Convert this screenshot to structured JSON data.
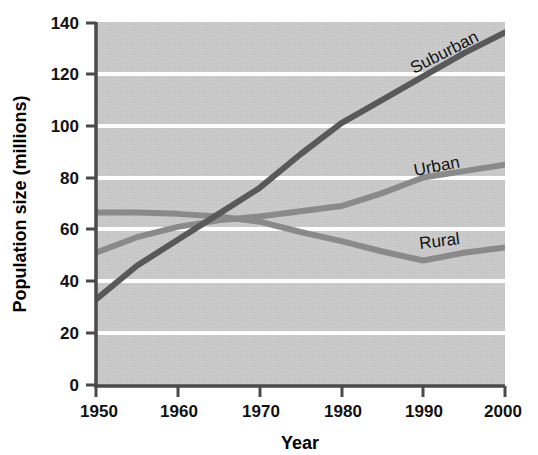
{
  "chart_data": {
    "type": "line",
    "title": "",
    "xlabel": "Year",
    "ylabel": "Population size (millions)",
    "xlim": [
      1950,
      2000
    ],
    "ylim": [
      0,
      140
    ],
    "xticks": [
      1950,
      1960,
      1970,
      1980,
      1990,
      2000
    ],
    "yticks": [
      0,
      20,
      40,
      60,
      80,
      100,
      120,
      140
    ],
    "xtick_labels": [
      "1950",
      "1960",
      "1970",
      "1980",
      "1990",
      "2000"
    ],
    "ytick_labels": [
      "0",
      "20",
      "40",
      "60",
      "80",
      "100",
      "120",
      "140"
    ],
    "grid": "horizontal-white-gridlines",
    "legend": "inline-labels-on-lines",
    "plot_background": "#c9c9c9",
    "x": [
      1950,
      1955,
      1960,
      1965,
      1970,
      1975,
      1980,
      1985,
      1990,
      1995,
      2000
    ],
    "series": [
      {
        "name": "Suburban",
        "color": "#595959",
        "label_rotation_deg": -27,
        "values": [
          33,
          46,
          56,
          66,
          76,
          89,
          101,
          110,
          119,
          128,
          136
        ]
      },
      {
        "name": "Urban",
        "color": "#8a8a8a",
        "label_rotation_deg": -11,
        "values": [
          51,
          57,
          61,
          63.5,
          65,
          67,
          69,
          74,
          80,
          82.5,
          85
        ]
      },
      {
        "name": "Rural",
        "color": "#8a8a8a",
        "label_rotation_deg": -7,
        "values": [
          66.5,
          66.5,
          66,
          65,
          63,
          59,
          55.5,
          51.5,
          48,
          51,
          53
        ]
      }
    ],
    "annotations": [
      {
        "text": "Suburban",
        "near_x": 1989,
        "near_y": 124
      },
      {
        "text": "Urban",
        "near_x": 1989,
        "near_y": 90
      },
      {
        "text": "Rural",
        "near_x": 1989,
        "near_y": 58
      }
    ]
  },
  "axes": {
    "y_title": "Population size (millions)",
    "x_title": "Year",
    "y_ticks": [
      "140",
      "120",
      "100",
      "80",
      "60",
      "40",
      "20",
      "0"
    ],
    "x_ticks": [
      "1950",
      "1960",
      "1970",
      "1980",
      "1990",
      "2000"
    ]
  },
  "series_labels": {
    "suburban": "Suburban",
    "urban": "Urban",
    "rural": "Rural"
  },
  "colors": {
    "plot_background": "#c9c9c9",
    "gridline": "#ffffff",
    "axis": "#4a4a4a",
    "suburban_line": "#595959",
    "urban_line": "#8a8a8a",
    "rural_line": "#8a8a8a",
    "text": "#111111"
  }
}
